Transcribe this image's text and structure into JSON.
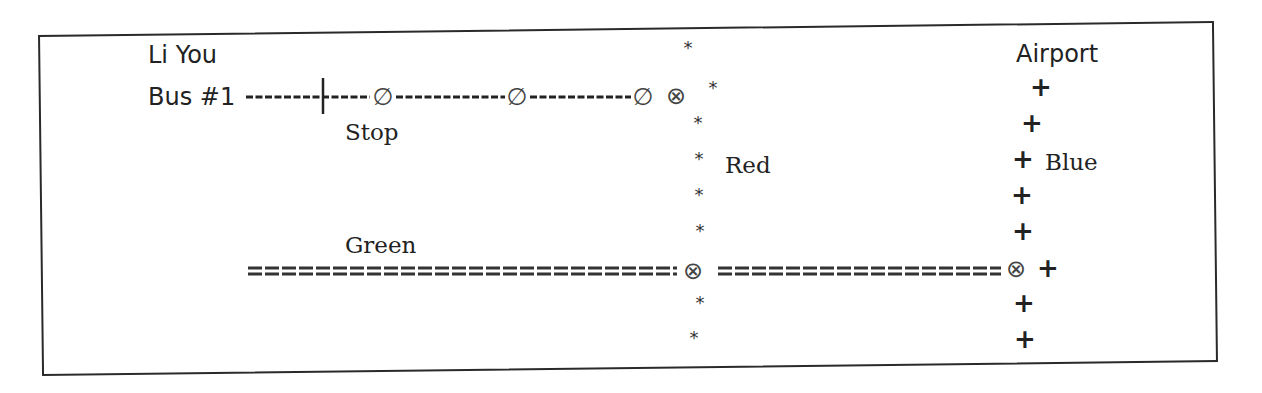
{
  "diagram": {
    "labels": {
      "passenger": "Li You",
      "bus": "Bus #1",
      "stop": "Stop",
      "red": "Red",
      "green": "Green",
      "blue": "Blue",
      "airport": "Airport"
    },
    "symbols": {
      "stop_marker": "∅",
      "transfer": "⊗",
      "red_marker": "*",
      "blue_marker": "+"
    },
    "legend_semantics": {
      "bus_line_style": "dashed single line (----)",
      "green_line_style": "double dashed line (====)",
      "red_line_style": "asterisks (*)",
      "blue_line_style": "plus signs (+)",
      "stop_style": "∅ circle with slash",
      "transfer_style": "⊗ circle with x"
    },
    "routes": [
      {
        "name": "Bus #1",
        "orientation": "horizontal",
        "stops": 3,
        "ends_at": "Red transfer"
      },
      {
        "name": "Red",
        "orientation": "vertical",
        "transfers": [
          "Bus #1",
          "Green"
        ]
      },
      {
        "name": "Green",
        "orientation": "horizontal",
        "transfers": [
          "Red",
          "Blue"
        ]
      },
      {
        "name": "Blue",
        "orientation": "vertical",
        "destination": "Airport",
        "transfers": [
          "Green"
        ]
      }
    ],
    "colors": {
      "ink": "#222222",
      "frame": "#2a2a2a",
      "background": "#ffffff"
    }
  }
}
